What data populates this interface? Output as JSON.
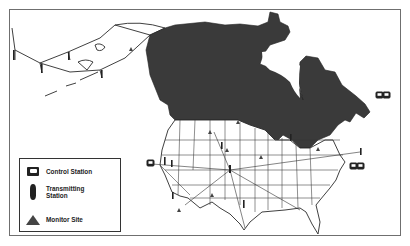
{
  "map": {
    "region": "North America",
    "colors": {
      "canada_fill": "#3a3a3a",
      "us_fill": "#ffffff",
      "outline": "#2a2a2a",
      "frame": "#6f6f6f"
    },
    "control_stations": [
      {
        "x": 150,
        "y": 164,
        "label": "control-station-west"
      },
      {
        "x": 362,
        "y": 165,
        "label": "control-station-east"
      },
      {
        "x": 379,
        "y": 95,
        "label": "control-station-northeast"
      }
    ],
    "monitor_sites": [
      {
        "x": 131,
        "y": 50
      },
      {
        "x": 238,
        "y": 123
      },
      {
        "x": 210,
        "y": 133
      },
      {
        "x": 227,
        "y": 151
      },
      {
        "x": 212,
        "y": 196
      },
      {
        "x": 179,
        "y": 211
      },
      {
        "x": 261,
        "y": 158
      },
      {
        "x": 318,
        "y": 150
      }
    ]
  },
  "legend": {
    "items": [
      {
        "icon": "control-station-icon",
        "label": "Control Station"
      },
      {
        "icon": "transmitting-station-icon",
        "label": "Transmitting Station"
      },
      {
        "icon": "monitor-site-icon",
        "label": "Monitor Site"
      }
    ]
  }
}
